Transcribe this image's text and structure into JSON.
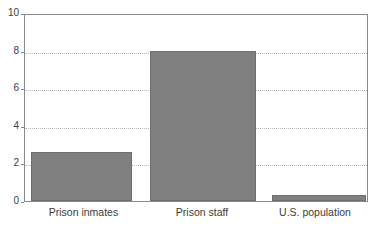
{
  "chart_data": {
    "type": "bar",
    "title": "",
    "subtitle": "",
    "xlabel": "",
    "ylabel": "",
    "categories": [
      "Prison inmates",
      "Prison staff",
      "U.S. population"
    ],
    "values": [
      2.65,
      8.05,
      0.3
    ],
    "series": [
      {
        "name": "",
        "values": [
          2.65,
          8.05,
          0.3
        ]
      }
    ],
    "ylim": [
      0,
      10
    ],
    "yticks": [
      0,
      2,
      4,
      6,
      8,
      10
    ],
    "ytick_labels": [
      "0",
      "2",
      "4",
      "6",
      "8",
      "10"
    ],
    "grid": true,
    "grid_axis": "y",
    "legend": false,
    "legend_position": "none",
    "annotations": [],
    "bar_color": "#808080",
    "bar_border_color": "#6e6e6e",
    "grid_color": "#b9b9b9",
    "axis_color": "#8a8a8a",
    "background_color": "#ffffff",
    "text_color": "#3b3b3b"
  }
}
